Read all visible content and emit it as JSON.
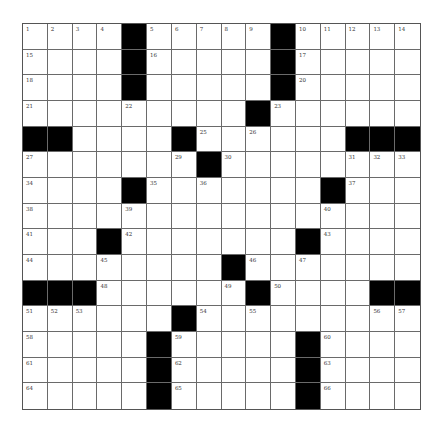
{
  "puzzle": {
    "columns": 16,
    "rows": 15,
    "colors": {
      "block": "#000000",
      "cell": "#ffffff",
      "gridline": "#6a6a6a",
      "number": "#333333"
    },
    "grid": [
      [
        "1",
        "2",
        "3",
        "4",
        "#",
        "5",
        "6",
        "7",
        "8",
        "9",
        "#",
        "10",
        "11",
        "12",
        "13",
        "14"
      ],
      [
        "15",
        ".",
        ".",
        ".",
        "#",
        "16",
        ".",
        ".",
        ".",
        ".",
        "#",
        "17",
        ".",
        ".",
        ".",
        "."
      ],
      [
        "18",
        ".",
        ".",
        ".",
        "#",
        ".",
        ".",
        ".",
        ".",
        ".",
        "#",
        "20",
        ".",
        ".",
        ".",
        "."
      ],
      [
        "21",
        ".",
        ".",
        ".",
        "22",
        ".",
        ".",
        ".",
        ".",
        "#",
        "23",
        ".",
        ".",
        ".",
        ".",
        "."
      ],
      [
        "#",
        "#",
        ".",
        ".",
        ".",
        ".",
        "#",
        "25",
        ".",
        "26",
        ".",
        ".",
        ".",
        "#",
        "#",
        "#"
      ],
      [
        "27",
        ".",
        ".",
        ".",
        ".",
        ".",
        "29",
        "#",
        "30",
        ".",
        ".",
        ".",
        ".",
        "31",
        "32",
        "33"
      ],
      [
        "34",
        ".",
        ".",
        ".",
        "#",
        "35",
        ".",
        "36",
        ".",
        ".",
        ".",
        ".",
        "#",
        "37",
        ".",
        "."
      ],
      [
        "38",
        ".",
        ".",
        ".",
        "39",
        ".",
        ".",
        ".",
        ".",
        ".",
        ".",
        ".",
        "40",
        ".",
        ".",
        "."
      ],
      [
        "41",
        ".",
        ".",
        "#",
        "42",
        ".",
        ".",
        ".",
        ".",
        ".",
        ".",
        "#",
        "43",
        ".",
        ".",
        "."
      ],
      [
        "44",
        ".",
        ".",
        "45",
        ".",
        ".",
        ".",
        ".",
        "#",
        "46",
        ".",
        "47",
        ".",
        ".",
        ".",
        "."
      ],
      [
        "#",
        "#",
        "#",
        "48",
        ".",
        ".",
        ".",
        ".",
        "49",
        "#",
        "50",
        ".",
        ".",
        ".",
        "#",
        "#"
      ],
      [
        "51",
        "52",
        "53",
        ".",
        ".",
        ".",
        "#",
        "54",
        ".",
        "55",
        ".",
        ".",
        ".",
        ".",
        "56",
        "57"
      ],
      [
        "58",
        ".",
        ".",
        ".",
        ".",
        "#",
        "59",
        ".",
        ".",
        ".",
        ".",
        "#",
        "60",
        ".",
        ".",
        "."
      ],
      [
        "61",
        ".",
        ".",
        ".",
        ".",
        "#",
        "62",
        ".",
        ".",
        ".",
        ".",
        "#",
        "63",
        ".",
        ".",
        "."
      ],
      [
        "64",
        ".",
        ".",
        ".",
        ".",
        "#",
        "65",
        ".",
        ".",
        ".",
        ".",
        "#",
        "66",
        ".",
        ".",
        "."
      ]
    ]
  }
}
